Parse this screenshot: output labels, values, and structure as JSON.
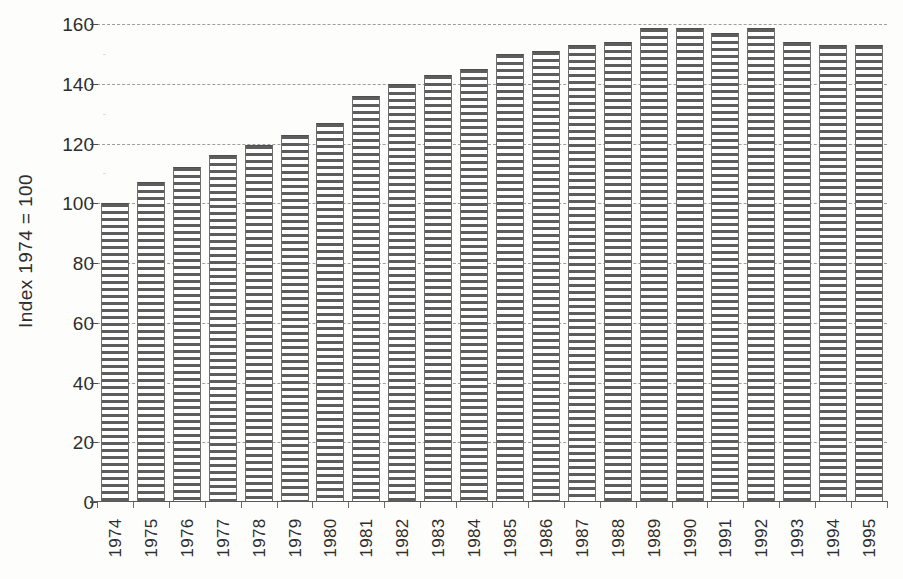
{
  "chart_data": {
    "type": "bar",
    "title": "",
    "subtitle": "",
    "xlabel": "",
    "ylabel": "Index 1974 = 100",
    "categories": [
      "1974",
      "1975",
      "1976",
      "1977",
      "1978",
      "1979",
      "1980",
      "1981",
      "1982",
      "1983",
      "1984",
      "1985",
      "1986",
      "1987",
      "1988",
      "1989",
      "1990",
      "1991",
      "1992",
      "1993",
      "1994",
      "1995"
    ],
    "values": [
      100,
      107,
      112,
      116,
      119.5,
      123,
      127,
      136,
      140,
      143,
      145,
      150,
      151,
      153,
      154,
      158.5,
      158.5,
      157,
      158.5,
      154,
      153,
      153
    ],
    "series": [
      {
        "name": "Index",
        "values": [
          100,
          107,
          112,
          116,
          119.5,
          123,
          127,
          136,
          140,
          143,
          145,
          150,
          151,
          153,
          154,
          158.5,
          158.5,
          157,
          158.5,
          154,
          153,
          153
        ]
      }
    ],
    "ylim": [
      0,
      160
    ],
    "xlim_categories": 22,
    "y_ticks": [
      0,
      20,
      40,
      60,
      80,
      100,
      120,
      140,
      160
    ],
    "y_tick_labels": [
      "0",
      "20",
      "40",
      "60",
      "80",
      "100",
      "120",
      "140",
      "160"
    ],
    "grid": true,
    "grid_style": "dashed",
    "grid_axis": "y",
    "legend": false,
    "legend_position": "none",
    "bar_fill": "horizontal-line-hatch",
    "annotations": []
  },
  "axis": {
    "y_title": "Index 1974 = 100",
    "y_tick_labels": [
      "160",
      "140",
      "120",
      "100",
      "80",
      "60",
      "40",
      "20",
      "0"
    ],
    "x_tick_labels": [
      "1974",
      "1975",
      "1976",
      "1977",
      "1978",
      "1979",
      "1980",
      "1981",
      "1982",
      "1983",
      "1984",
      "1985",
      "1986",
      "1987",
      "1988",
      "1989",
      "1990",
      "1991",
      "1992",
      "1993",
      "1994",
      "1995"
    ]
  },
  "colors": {
    "background": "#fdfdfc",
    "bar_stroke": "#5d5d5d",
    "bar_fill": "#ffffff",
    "gridline": "#8e8e8e",
    "axis_line": "#5a5a5a",
    "text": "#2e2e2e"
  }
}
